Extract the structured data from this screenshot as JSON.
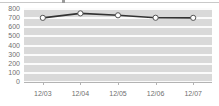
{
  "chart_data": {
    "type": "line",
    "title": "",
    "subtitle": "",
    "xlabel": "",
    "ylabel": "",
    "categories": [
      "12/03",
      "12/04",
      "12/05",
      "12/06",
      "12/07"
    ],
    "series": [
      {
        "name": "series-1",
        "values": [
          703,
          752,
          731,
          704,
          703
        ],
        "marker": "circle-open",
        "line_color": "#333333",
        "marker_fill": "#ffffff",
        "marker_edge": "#555555"
      }
    ],
    "ylim": [
      0,
      800
    ],
    "y_ticks": [
      0,
      100,
      200,
      300,
      400,
      500,
      600,
      700,
      800
    ],
    "y_tick_labels": [
      "0",
      "100",
      "200",
      "300",
      "400",
      "500",
      "600",
      "700",
      "800"
    ],
    "x_tick_labels": [
      "12/03",
      "12/04",
      "12/05",
      "12/06",
      "12/07"
    ],
    "grid": true,
    "grid_orientation": "horizontal",
    "grid_color": "#fbfbfb",
    "plot_background": "#d9d9d9",
    "figure_background": "#ffffff",
    "legend": false,
    "legend_position": "none",
    "axis_label_color": "#6f6f6f"
  },
  "axes": {
    "y_axis_name": "y-axis",
    "x_axis_name": "x-axis"
  }
}
